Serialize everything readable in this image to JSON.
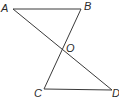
{
  "diagram": {
    "type": "geometry",
    "points": {
      "A": {
        "label": "A"
      },
      "B": {
        "label": "B"
      },
      "C": {
        "label": "C"
      },
      "D": {
        "label": "D"
      },
      "O": {
        "label": "O"
      }
    },
    "segments": [
      {
        "from": "A",
        "to": "B"
      },
      {
        "from": "A",
        "to": "D"
      },
      {
        "from": "B",
        "to": "C"
      },
      {
        "from": "C",
        "to": "D"
      }
    ],
    "colors": {
      "line": "#3a3a3a",
      "text": "#2a2a2a",
      "background": "#ffffff"
    }
  }
}
